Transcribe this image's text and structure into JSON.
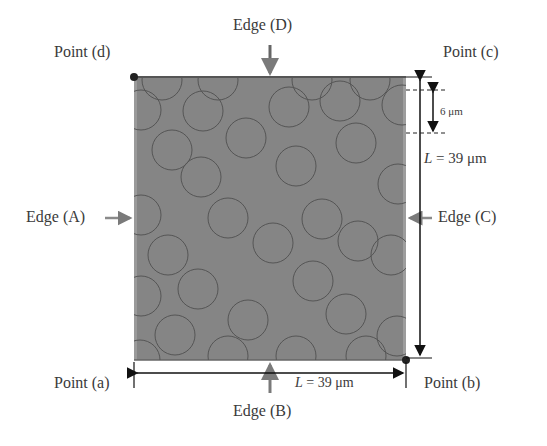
{
  "labels": {
    "point_d": "Point (d)",
    "point_c": "Point (c)",
    "point_a": "Point (a)",
    "point_b": "Point (b)",
    "edge_a": "Edge (A)",
    "edge_b": "Edge (B)",
    "edge_c": "Edge (C)",
    "edge_d": "Edge (D)",
    "fiber_diameter": "6 μm",
    "length_vertical": "L = 39 μm",
    "length_horizontal": "L = 39 μm"
  },
  "colors": {
    "matrix": "#858585",
    "fiber_outline": "#555555",
    "arrow_gray": "#7a7a7a",
    "dimension_line": "#111111"
  },
  "geometry": {
    "square": {
      "x": 133,
      "y": 77,
      "size": 273
    },
    "fiber_radius": 20,
    "fibers": [
      [
        162,
        80
      ],
      [
        218,
        80
      ],
      [
        312,
        80
      ],
      [
        370,
        80
      ],
      [
        141,
        110
      ],
      [
        203,
        111
      ],
      [
        289,
        107
      ],
      [
        340,
        101
      ],
      [
        402,
        105
      ],
      [
        172,
        150
      ],
      [
        246,
        138
      ],
      [
        356,
        143
      ],
      [
        201,
        177
      ],
      [
        296,
        166
      ],
      [
        398,
        184
      ],
      [
        141,
        215
      ],
      [
        228,
        218
      ],
      [
        322,
        219
      ],
      [
        168,
        255
      ],
      [
        273,
        243
      ],
      [
        358,
        241
      ],
      [
        141,
        296
      ],
      [
        198,
        289
      ],
      [
        313,
        281
      ],
      [
        391,
        255
      ],
      [
        175,
        335
      ],
      [
        248,
        320
      ],
      [
        346,
        314
      ],
      [
        397,
        336
      ],
      [
        228,
        356
      ],
      [
        296,
        356
      ],
      [
        366,
        356
      ],
      [
        140,
        360
      ]
    ]
  }
}
